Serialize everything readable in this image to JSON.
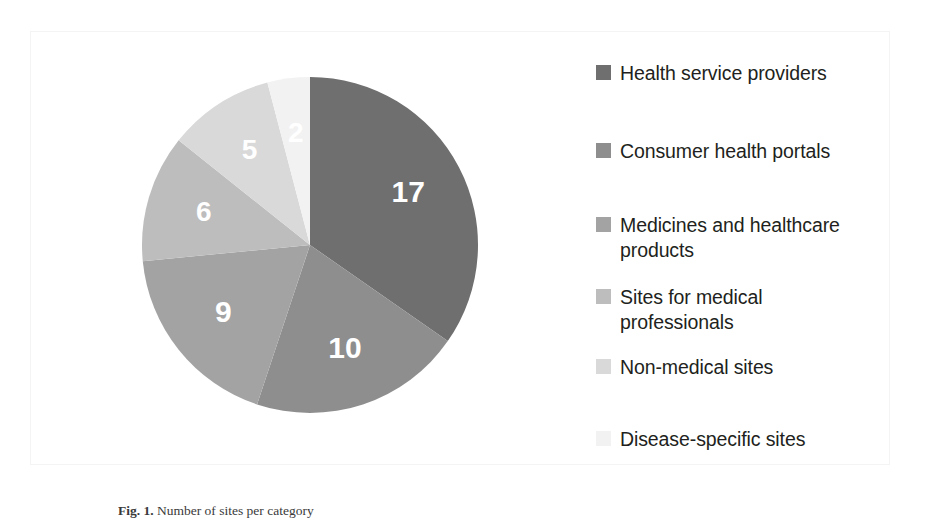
{
  "figure": {
    "caption_label": "Fig. 1.",
    "caption_text": "Number of sites per category"
  },
  "chart_data": {
    "type": "pie",
    "title": "",
    "total": 49,
    "start_angle_deg": 0,
    "direction": "clockwise",
    "legend_position": "right",
    "grid": false,
    "categories": [
      "Health service providers",
      "Consumer health portals",
      "Medicines and healthcare products",
      "Sites for medical professionals",
      "Non-medical sites",
      "Disease-specific sites"
    ],
    "values": [
      17,
      10,
      9,
      6,
      5,
      2
    ],
    "labels": [
      "17",
      "10",
      "9",
      "6",
      "5",
      "2"
    ],
    "colors": [
      "#6f6f6f",
      "#8e8e8e",
      "#a3a3a3",
      "#bdbdbd",
      "#d9d9d9",
      "#f2f2f2"
    ],
    "label_color": "#ffffff"
  },
  "legend": {
    "items": [
      {
        "label": "Health service providers",
        "color": "#6f6f6f",
        "value": 17
      },
      {
        "label": "Consumer health portals",
        "color": "#8e8e8e",
        "value": 10
      },
      {
        "label": "Medicines and healthcare\nproducts",
        "color": "#a3a3a3",
        "value": 9
      },
      {
        "label": "Sites for medical\nprofessionals",
        "color": "#bdbdbd",
        "value": 6
      },
      {
        "label": "Non-medical sites",
        "color": "#d9d9d9",
        "value": 5
      },
      {
        "label": "Disease-specific sites",
        "color": "#f2f2f2",
        "value": 2
      }
    ]
  }
}
